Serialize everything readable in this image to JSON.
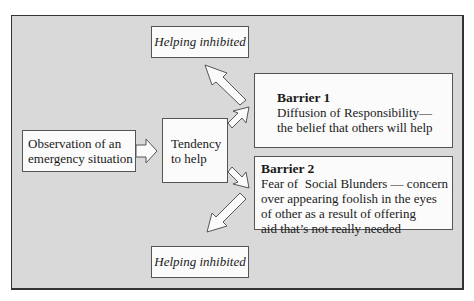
{
  "diagram": {
    "nodes": {
      "observation": {
        "lines": [
          "Observation of an",
          "emergency situation"
        ]
      },
      "tendency": {
        "lines": [
          "Tendency",
          "to help"
        ]
      },
      "barrier1": {
        "title": "Barrier 1",
        "lines": [
          "Diffusion of Responsibility—",
          "the belief that others will help"
        ]
      },
      "barrier2": {
        "title": "Barrier 2",
        "lines": [
          "Fear of  Social Blunders — concern",
          "over appearing foolish in the eyes",
          "of other as a result of offering",
          "aid that’s not really needed"
        ]
      },
      "inhibited_top": {
        "label": "Helping inhibited"
      },
      "inhibited_bottom": {
        "label": "Helping inhibited"
      }
    },
    "edges": [
      {
        "from": "observation",
        "to": "tendency"
      },
      {
        "from": "tendency",
        "to": "barrier1"
      },
      {
        "from": "tendency",
        "to": "barrier2"
      },
      {
        "from": "barrier1",
        "to": "inhibited_top"
      },
      {
        "from": "barrier2",
        "to": "inhibited_bottom"
      }
    ],
    "colors": {
      "background": "#d9d9d9",
      "box": "#fbfbfb",
      "border": "#555555"
    }
  }
}
